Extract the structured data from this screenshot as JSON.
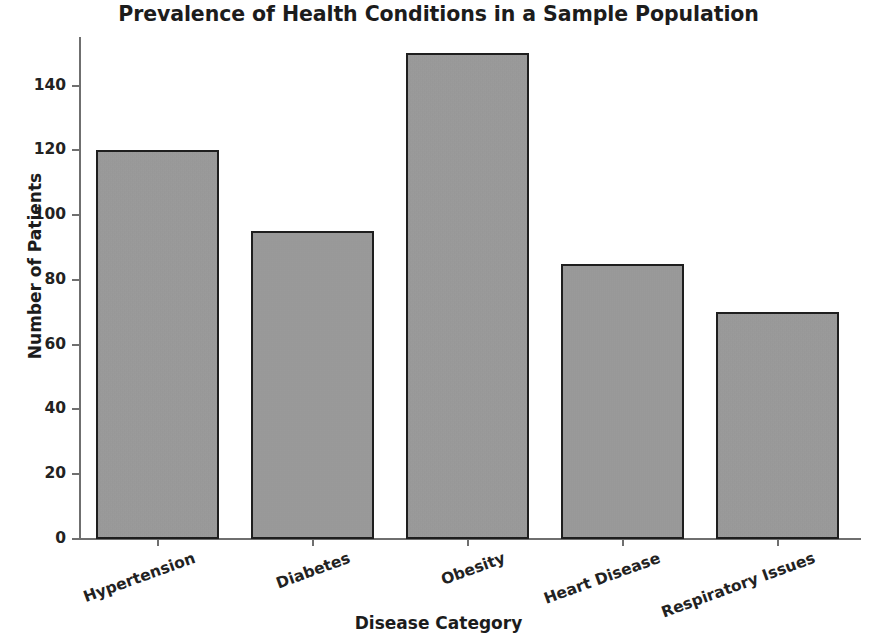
{
  "chart_data": {
    "type": "bar",
    "title": "Prevalence of Health Conditions in a Sample Population",
    "xlabel": "Disease Category",
    "ylabel": "Number of Patients",
    "categories": [
      "Hypertension",
      "Diabetes",
      "Obesity",
      "Heart Disease",
      "Respiratory Issues"
    ],
    "values": [
      120,
      95,
      150,
      85,
      70
    ],
    "ylim": [
      0,
      155
    ],
    "yticks": [
      0,
      20,
      40,
      60,
      80,
      100,
      120,
      140
    ],
    "ytick_labels": [
      "0",
      "20",
      "40",
      "60",
      "80",
      "100",
      "120",
      "140"
    ],
    "grid": false,
    "legend": null,
    "bar_color": "#9b9b9b",
    "bar_edge_color": "#1e1e1e",
    "background_color": "#ffffff",
    "axis_color": "#6f6f6f",
    "xtick_label_rotation": -20
  }
}
